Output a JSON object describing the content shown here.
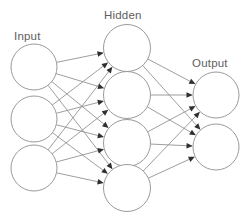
{
  "diagram": {
    "type": "neural-network-architecture",
    "title": "",
    "canvas": {
      "width": 242,
      "height": 219,
      "background": "#ffffff"
    },
    "style": {
      "node_fill": "#ffffff",
      "node_stroke": "#9a9a9a",
      "edge_color": "#8c8c8c",
      "arrow_color": "#2f2f2f",
      "label_color": "#5e5e5e"
    },
    "layers": [
      {
        "id": "input",
        "label": "Input",
        "label_x": 14,
        "label_y": 40,
        "node_count": 3,
        "radius": 23,
        "cx": 34,
        "centers_y": [
          67,
          119,
          168
        ]
      },
      {
        "id": "hidden",
        "label": "Hidden",
        "label_x": 104,
        "label_y": 19,
        "node_count": 4,
        "radius": 23.5,
        "cx": 127,
        "centers_y": [
          48,
          95,
          143,
          188
        ]
      },
      {
        "id": "output",
        "label": "Output",
        "label_x": 192,
        "label_y": 67,
        "node_count": 2,
        "radius": 23,
        "cx": 216,
        "centers_y": [
          95,
          147
        ]
      }
    ],
    "connections": [
      {
        "from_layer": "input",
        "to_layer": "hidden",
        "fully_connected": true,
        "edge_count": 12,
        "directed": true
      },
      {
        "from_layer": "hidden",
        "to_layer": "output",
        "fully_connected": true,
        "edge_count": 8,
        "directed": true
      }
    ]
  }
}
